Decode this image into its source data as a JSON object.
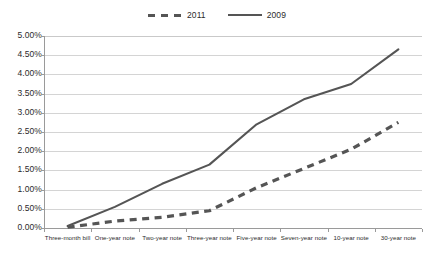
{
  "chart_data": {
    "type": "line",
    "title": "",
    "xlabel": "",
    "ylabel": "",
    "categories": [
      "Three-month bill",
      "One-year note",
      "Two-year note",
      "Three-year note",
      "Five-year note",
      "Seven-year note",
      "10-year note",
      "30-year note"
    ],
    "series": [
      {
        "name": "2011",
        "style": "dashed",
        "color": "#555555",
        "values": [
          0.02,
          0.18,
          0.28,
          0.45,
          1.05,
          1.55,
          2.05,
          2.75
        ]
      },
      {
        "name": "2009",
        "style": "solid",
        "color": "#555555",
        "values": [
          0.05,
          0.55,
          1.15,
          1.65,
          2.7,
          3.35,
          3.75,
          4.65
        ]
      }
    ],
    "ylim": [
      0,
      5
    ],
    "ytick_values": [
      5.0,
      4.5,
      4.0,
      3.5,
      3.0,
      2.5,
      2.0,
      1.5,
      1.0,
      0.5,
      0.0
    ],
    "ytick_labels": [
      "5.00%",
      "4.50%",
      "4.00%",
      "3.50%",
      "3.00%",
      "2.50%",
      "2.00%",
      "1.50%",
      "1.00%",
      "0.50%",
      "0.00%"
    ],
    "grid": true,
    "legend_position": "top-center",
    "value_suffix": "%"
  },
  "legend": {
    "entries": [
      {
        "label": "2011",
        "style": "dashed"
      },
      {
        "label": "2009",
        "style": "solid"
      }
    ]
  },
  "colors": {
    "series_line": "#555555",
    "gridline": "#d4d4d4",
    "axis": "#9a9a9a",
    "text": "#2b2b2b",
    "background": "#ffffff"
  }
}
